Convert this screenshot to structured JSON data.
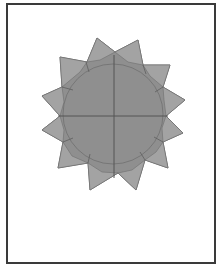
{
  "figure": {
    "colors": {
      "fill": "#8f8f8f",
      "flap_fill": "#a3a3a3",
      "crease": "#555555",
      "frame": "#3a3a3a",
      "background": "#ffffff"
    },
    "points": 12
  }
}
